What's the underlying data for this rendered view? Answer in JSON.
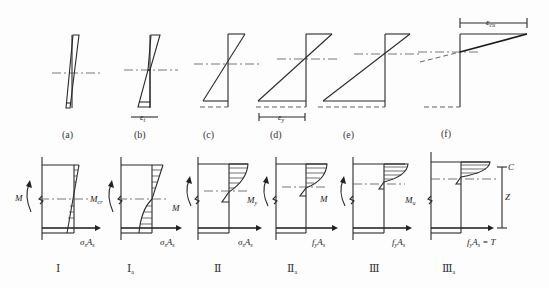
{
  "strain_diagrams": {
    "labels": [
      "(a)",
      "(b)",
      "(c)",
      "(d)",
      "(e)",
      "(f)"
    ],
    "epsilon_t": {
      "base": "ε",
      "sub": "t"
    },
    "epsilon_y": {
      "base": "ε",
      "sub": "y"
    },
    "epsilon_cu": {
      "base": "ε",
      "sub": "cu"
    }
  },
  "stress_diagrams": {
    "stage_labels": [
      {
        "base": "Ⅰ",
        "sub": ""
      },
      {
        "base": "Ⅰ",
        "sub": "a"
      },
      {
        "base": "Ⅱ",
        "sub": ""
      },
      {
        "base": "Ⅱ",
        "sub": "a"
      },
      {
        "base": "Ⅲ",
        "sub": ""
      },
      {
        "base": "Ⅲ",
        "sub": "a"
      }
    ],
    "moment_labels": {
      "M": "M",
      "M_cr": {
        "base": "M",
        "sub": "cr"
      },
      "M_y": {
        "base": "M",
        "sub": "y"
      },
      "M_u": {
        "base": "M",
        "sub": "u"
      }
    },
    "force_labels": {
      "sigma_s_As": {
        "a": "σ",
        "a_sub": "s",
        "b": "A",
        "b_sub": "s"
      },
      "fy_As": {
        "a": "f",
        "a_sub": "y",
        "b": "A",
        "b_sub": "s"
      },
      "fy_As_T": {
        "a": "f",
        "a_sub": "y",
        "b": "A",
        "b_sub": "s",
        "tail": " = T"
      }
    },
    "lever_arm": {
      "C": "C",
      "Z": "Z"
    }
  }
}
